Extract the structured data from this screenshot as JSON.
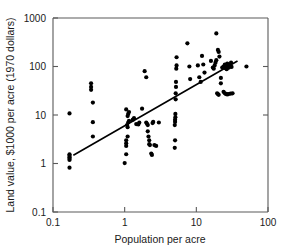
{
  "chart_data": {
    "type": "scatter",
    "title": "",
    "xlabel": "Population per acre",
    "ylabel": "Land value, $1000 per acre (1970 dollars)",
    "xscale": "log",
    "yscale": "log",
    "xlim": [
      0.1,
      100
    ],
    "ylim": [
      0.1,
      1000
    ],
    "xticks": [
      "0.1",
      "1",
      "10",
      "100"
    ],
    "xtick_values": [
      0.1,
      1,
      10,
      100
    ],
    "yticks": [
      "0.1",
      "1",
      "10",
      "100",
      "1000"
    ],
    "ytick_values": [
      0.1,
      1,
      10,
      100,
      1000
    ],
    "grid": false,
    "legend": null,
    "marker": "filled-circle",
    "marker_color": "#000000",
    "points": [
      [
        0.17,
        10.8
      ],
      [
        0.17,
        1.55
      ],
      [
        0.17,
        1.45
      ],
      [
        0.17,
        1.35
      ],
      [
        0.17,
        1.25
      ],
      [
        0.17,
        1.18
      ],
      [
        0.17,
        0.82
      ],
      [
        0.36,
        18.0
      ],
      [
        0.36,
        7.1
      ],
      [
        0.36,
        3.6
      ],
      [
        0.34,
        45.0
      ],
      [
        0.34,
        38.0
      ],
      [
        0.34,
        33.0
      ],
      [
        1.0,
        1.02
      ],
      [
        1.05,
        1.55
      ],
      [
        1.05,
        2.3
      ],
      [
        1.05,
        2.6
      ],
      [
        1.05,
        3.0
      ],
      [
        1.1,
        3.6
      ],
      [
        1.1,
        5.6
      ],
      [
        1.08,
        6.2
      ],
      [
        1.12,
        7.0
      ],
      [
        1.15,
        7.6
      ],
      [
        1.1,
        9.5
      ],
      [
        1.12,
        10.5
      ],
      [
        1.15,
        11.5
      ],
      [
        1.05,
        13.0
      ],
      [
        1.3,
        8.0
      ],
      [
        1.35,
        8.6
      ],
      [
        1.45,
        6.5
      ],
      [
        1.55,
        6.4
      ],
      [
        1.6,
        7.0
      ],
      [
        1.75,
        13.5
      ],
      [
        1.9,
        80.0
      ],
      [
        2.0,
        60.0
      ],
      [
        2.0,
        7.0
      ],
      [
        2.05,
        6.6
      ],
      [
        2.1,
        6.2
      ],
      [
        2.1,
        4.6
      ],
      [
        2.15,
        3.6
      ],
      [
        2.2,
        3.0
      ],
      [
        2.2,
        2.5
      ],
      [
        2.25,
        2.4
      ],
      [
        2.35,
        1.6
      ],
      [
        2.4,
        1.5
      ],
      [
        2.45,
        6.8
      ],
      [
        2.5,
        7.2
      ],
      [
        2.6,
        2.4
      ],
      [
        2.75,
        2.3
      ],
      [
        3.0,
        7.0
      ],
      [
        5.0,
        2.1
      ],
      [
        5.05,
        3.0
      ],
      [
        5.0,
        6.2
      ],
      [
        5.05,
        7.2
      ],
      [
        5.05,
        8.0
      ],
      [
        5.1,
        9.0
      ],
      [
        5.1,
        10.5
      ],
      [
        5.15,
        21.0
      ],
      [
        5.15,
        28.0
      ],
      [
        5.2,
        38.0
      ],
      [
        5.2,
        48.0
      ],
      [
        5.25,
        90.0
      ],
      [
        5.3,
        105.0
      ],
      [
        5.3,
        155.0
      ],
      [
        7.5,
        300.0
      ],
      [
        8.0,
        100.0
      ],
      [
        8.2,
        55.0
      ],
      [
        10.5,
        105.0
      ],
      [
        11.0,
        60.0
      ],
      [
        11.5,
        48.0
      ],
      [
        12.0,
        165.0
      ],
      [
        12.5,
        110.0
      ],
      [
        13.0,
        75.0
      ],
      [
        16.0,
        130.0
      ],
      [
        17.0,
        95.0
      ],
      [
        17.5,
        90.0
      ],
      [
        18.0,
        105.0
      ],
      [
        18.5,
        120.0
      ],
      [
        19.0,
        135.0
      ],
      [
        19.5,
        28.0
      ],
      [
        20.0,
        27.0
      ],
      [
        20.5,
        26.0
      ],
      [
        19.0,
        480.0
      ],
      [
        20.0,
        220.0
      ],
      [
        20.5,
        200.0
      ],
      [
        21.0,
        160.0
      ],
      [
        22.0,
        58.0
      ],
      [
        23.0,
        95.0
      ],
      [
        24.0,
        100.0
      ],
      [
        25.0,
        110.0
      ],
      [
        25.5,
        92.0
      ],
      [
        26.0,
        105.0
      ],
      [
        26.5,
        88.0
      ],
      [
        27.0,
        115.0
      ],
      [
        28.0,
        100.0
      ],
      [
        28.5,
        95.0
      ],
      [
        29.0,
        108.0
      ],
      [
        30.0,
        102.0
      ],
      [
        30.5,
        120.0
      ],
      [
        31.0,
        98.0
      ],
      [
        24.0,
        30.0
      ],
      [
        25.0,
        28.0
      ],
      [
        26.0,
        27.0
      ],
      [
        27.0,
        26.5
      ],
      [
        28.0,
        27.0
      ],
      [
        30.0,
        27.5
      ],
      [
        32.0,
        28.0
      ],
      [
        22.0,
        45.0
      ],
      [
        50.0,
        100.0
      ]
    ],
    "fit_line": {
      "label": "regression-line",
      "x_start": 0.195,
      "y_start": 1.5,
      "x_end": 37.0,
      "y_end": 128.0
    }
  }
}
